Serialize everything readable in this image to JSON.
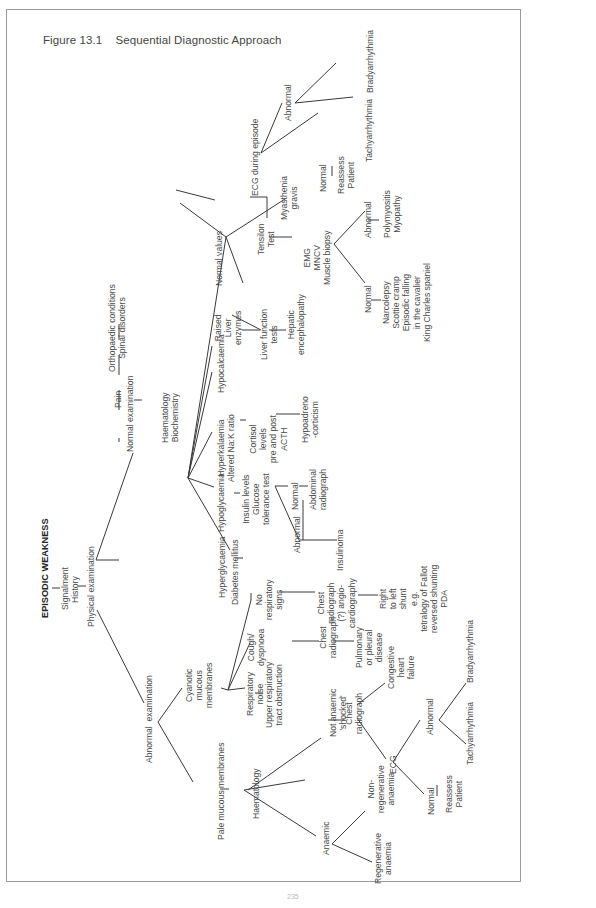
{
  "figure": {
    "title": "Figure 13.1    Sequential Diagnostic Approach",
    "page_number": "235"
  },
  "nodes": {
    "root": "EPISODIC WEAKNESS",
    "signalment": "Signalment",
    "history": "History",
    "physical_examination": "Physical examination",
    "pain": "Pain",
    "orthopaedic": "Orthopaedic conditions\nSpinal disorders",
    "normal_examination": "Normal examination",
    "haem_biochem": "Haematology\nBiochemistry",
    "abnormal_examination": "Abnormal  examination",
    "pale_mucous": "Pale mucous membranes",
    "haematology": "Haematology",
    "anaemic": "Anaemic",
    "regenerative": "Regenerative\nanaemia",
    "non_regenerative": "Non-\nregenerative\nanaemia",
    "not_anaemic": "Not anaemic\n'shocked'",
    "chest_radiograph_shock": "Chest\nradiograph",
    "congestive": "Congestive\nheart\nfailure",
    "ecg": "ECG",
    "ecg_normal": "Normal",
    "ecg_reassess": "Reassess\nPatient",
    "ecg_abnormal": "Abnormal",
    "ecg_tachy": "Tachyarrhythmia",
    "ecg_brady": "Bradyarrhythmia",
    "cyanotic": "Cyanotic\nmucous\nmembranes",
    "resp_noise": "Respiratory\nnoise",
    "upper_resp": "Upper respiratory\ntract obstruction",
    "cough": "Cough/\ndyspnoea",
    "chest_radiograph_cough": "Chest\nradiograph",
    "pulmonary": "Pulmonary\nor pleural\ndisease",
    "no_resp": "No\nrespiratory\nsigns",
    "chest_angio": "Chest\nradiograph\n(?) angio-\ncardiography",
    "right_left": "Right\nto left\nshunt\ne.g.\ntetralogy of Fallot\nreversed shunting\nPDA",
    "hyperglycaemia": "Hyperglycaemia",
    "diabetes": "Diabetes mellitus",
    "hypoglycaemia": "Hypoglycaemia",
    "insulin": "Insulin levels\nGlucose\ntolerance test",
    "gtt_abnormal": "Abnormal",
    "insulinoma": "Insulinoma",
    "gtt_normal": "Normal",
    "abdominal": "Abdominal\nradiograph",
    "hyperkalaemia": "Hyperkalaemia\nAltered Na:K ratio",
    "cortisol": "Cortisol\nlevels\npre and post\nACTH",
    "hypoadreno": "Hypoadreno\n-corticism",
    "hypocalcaemia": "Hypocalcaemia",
    "raised_liver": "Raised\nLiver\nenzymes",
    "liver_function": "Liver function\ntests",
    "hepatic": "Hepatic\nencephalopathy",
    "normal_values": "Normal values",
    "tensilon": "Tensilon\nTest",
    "myasthenia": "Myasthenia\ngravis",
    "emg": "EMG\nMNCV\nMuscle biopsy",
    "emg_normal": "Normal",
    "narcolepsy": "Narcolepsy\nScottie cramp\nEpisodic falling\nin the cavalier\nKing Charles spaniel",
    "emg_abnormal": "Abnormal",
    "polymyositis": "Polymyositis\nMyopathy",
    "ecg_episode": "ECG during episode",
    "ep_normal": "Normal",
    "ep_reassess": "Reassess\nPatient",
    "ep_abnormal": "Abnormal",
    "ep_tachy": "Tachyarrhythmia",
    "ep_brady": "Bradyarrhythmia"
  },
  "colors": {
    "line": "#3a3a3a",
    "frame": "#9a9a9a",
    "text": "#4a4a4a"
  }
}
